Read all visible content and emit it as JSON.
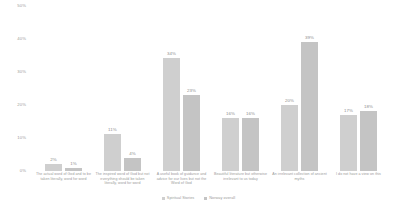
{
  "chart_data": {
    "type": "bar",
    "title": "",
    "xlabel": "",
    "ylabel": "",
    "ylim": [
      0,
      50
    ],
    "yunit": "%",
    "grid": false,
    "legend_position": "bottom-center",
    "categories": [
      "The actual word of God and to be taken literally, word for word",
      "The inspired word of God but not everything should be taken literally, word for word",
      "A useful book of guidance and advice for our lives but not the Word of God",
      "Beautiful literature but otherwise irrelevant to us today",
      "An irrelevant collection of ancient myths",
      "I do not have a view on this"
    ],
    "yticks": [
      "50%",
      "40%",
      "30%",
      "20%",
      "10%",
      "0%"
    ],
    "ytick_values": [
      50,
      40,
      30,
      20,
      10,
      0
    ],
    "series": [
      {
        "name": "Spiritual Stories",
        "color": "#cfcfcf",
        "values": [
          2,
          11,
          34,
          16,
          20,
          17
        ],
        "labels": [
          "2%",
          "11%",
          "34%",
          "16%",
          "20%",
          "17%"
        ]
      },
      {
        "name": "Norway overall",
        "color": "#c4c4c4",
        "values": [
          1,
          4,
          23,
          16,
          39,
          18
        ],
        "labels": [
          "1%",
          "4%",
          "23%",
          "16%",
          "39%",
          "18%"
        ]
      }
    ]
  }
}
